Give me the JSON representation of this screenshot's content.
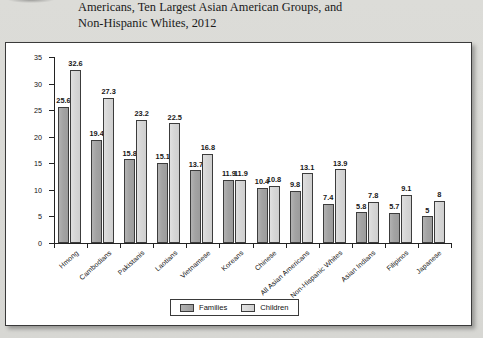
{
  "caption": {
    "line1": "Americans, Ten Largest Asian American Groups, and",
    "line2": "Non-Hispanic Whites, 2012"
  },
  "legend": {
    "families_label": "Families",
    "children_label": "Children"
  },
  "colors": {
    "families": "#a3a3a3",
    "children": "#d6d6d6",
    "axis": "#222222",
    "panel_background": "#ffffff",
    "page_background": "#d9d9d6"
  },
  "chart_data": {
    "type": "bar",
    "title": "Americans, Ten Largest Asian American Groups, and Non-Hispanic Whites, 2012",
    "xlabel": "",
    "ylabel": "",
    "ylim": [
      0,
      35
    ],
    "yticks": [
      0,
      5,
      10,
      15,
      20,
      25,
      30,
      35
    ],
    "grid": false,
    "legend_position": "bottom",
    "categories": [
      "Hmong",
      "Cambodians",
      "Pakistanis",
      "Laotians",
      "Vietnamese",
      "Koreans",
      "Chinese",
      "All Asian Americans",
      "Non-Hispanic Whites",
      "Asian Indians",
      "Filipinos",
      "Japanese"
    ],
    "series": [
      {
        "name": "Families",
        "values": [
          25.6,
          19.4,
          15.8,
          15.1,
          13.7,
          11.9,
          10.4,
          9.8,
          7.4,
          5.8,
          5.7,
          5
        ],
        "labels": [
          "25.6",
          "19.4",
          "15.8",
          "15.1",
          "13.7",
          "11.9",
          "10.4",
          "9.8",
          "7.4",
          "5.8",
          "5.7",
          "5"
        ]
      },
      {
        "name": "Children",
        "values": [
          32.6,
          27.3,
          23.2,
          22.5,
          16.8,
          11.9,
          10.8,
          13.1,
          13.9,
          7.8,
          9.1,
          8
        ],
        "labels": [
          "32.6",
          "27.3",
          "23.2",
          "22.5",
          "16.8",
          "11.9",
          "10.8",
          "13.1",
          "13.9",
          "7.8",
          "9.1",
          "8"
        ]
      }
    ]
  }
}
